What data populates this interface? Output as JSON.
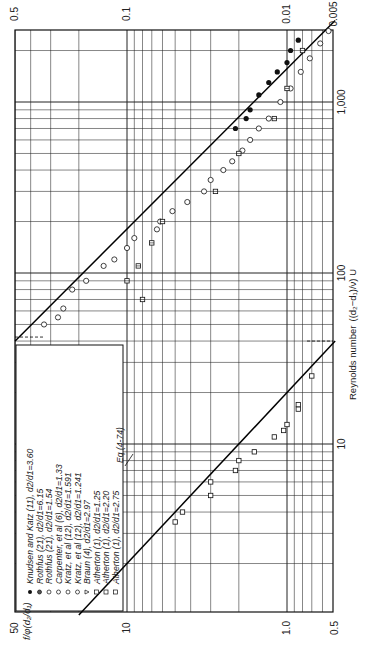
{
  "chart_data": {
    "type": "scatter",
    "title": "",
    "orientation": "rotated 90deg counter-clockwise (scanned figure)",
    "xlabel": "Reynolds number ((d2 - d1)/ν) U",
    "ylabel": "f/φ(d2/d1)",
    "xscale": "log",
    "yscale": "log",
    "xlim": [
      1,
      3000
    ],
    "ylim_left": [
      0.5,
      50
    ],
    "ylim_right": [
      0.005,
      0.5
    ],
    "x_ticks": [
      "10",
      "100",
      "1,000"
    ],
    "x_tick_values": [
      10,
      100,
      1000
    ],
    "y_ticks_left": [
      "50",
      "10",
      "1.0",
      "0.5"
    ],
    "y_tick_values_left": [
      50,
      10,
      1.0,
      0.5
    ],
    "y_ticks_right": [
      "0.5",
      "0.1",
      "0.01",
      "0.005"
    ],
    "y_tick_values_right": [
      0.5,
      0.1,
      0.01,
      0.005
    ],
    "grid": true,
    "legend_position": "upper left (rotated)",
    "legend": [
      {
        "symbol": "filled-circle",
        "label": "Knudsen and Katz (11), d2/d1=3.60"
      },
      {
        "symbol": "half-filled-circle",
        "label": "Rothfus (21), d2/d1=6.15"
      },
      {
        "symbol": "circle-tick",
        "label": "Rothfus (21), d2/d1=1.54"
      },
      {
        "symbol": "circle-bar",
        "label": "Carpenter, et al (6), d2/d1=1.33"
      },
      {
        "symbol": "circle-dot",
        "label": "Kratz, et al (12), d2/d1=1.591"
      },
      {
        "symbol": "diamond-circle",
        "label": "Kratz, et al (12), d2/d1=1.241"
      },
      {
        "symbol": "triangle",
        "label": "Braun (4), d2/d1=2.97"
      },
      {
        "symbol": "square-flag",
        "label": "Atherton (1), d2/d1=1.25"
      },
      {
        "symbol": "square-open",
        "label": "Atherton (1), d2/d1=2.20"
      },
      {
        "symbol": "square-d",
        "label": "Atherton (1), d2/d1=2.75"
      }
    ],
    "annotations": [
      {
        "text": "Eq (4-74)",
        "x": 8,
        "y": 2.4
      }
    ],
    "lines": [
      {
        "name": "Eq (4-74) laminar",
        "points": [
          [
            1,
            20
          ],
          [
            40,
            0.5
          ]
        ]
      },
      {
        "name": "turbulent",
        "points": [
          [
            40,
            50
          ],
          [
            3000,
            0.5
          ]
        ]
      }
    ],
    "series": [
      {
        "name": "laminar-region data",
        "symbol": "square-open",
        "points": [
          [
            3.5,
            5.0
          ],
          [
            4,
            4.5
          ],
          [
            5,
            3.0
          ],
          [
            6,
            3.0
          ],
          [
            7,
            2.1
          ],
          [
            8,
            2.0
          ],
          [
            9,
            1.6
          ],
          [
            11,
            1.2
          ],
          [
            12,
            1.05
          ],
          [
            13,
            1.0
          ],
          [
            16,
            0.85
          ],
          [
            17,
            0.85
          ],
          [
            25,
            0.7
          ]
        ]
      },
      {
        "name": "turbulent-region data (open)",
        "symbol": "circle-open",
        "points": [
          [
            50,
            33
          ],
          [
            55,
            27
          ],
          [
            62,
            25
          ],
          [
            80,
            22
          ],
          [
            90,
            18
          ],
          [
            110,
            14
          ],
          [
            120,
            12
          ],
          [
            140,
            10
          ],
          [
            160,
            9
          ],
          [
            180,
            6.5
          ],
          [
            200,
            6.2
          ],
          [
            230,
            5.2
          ],
          [
            260,
            4.2
          ],
          [
            300,
            3.3
          ],
          [
            350,
            3.0
          ],
          [
            400,
            2.5
          ],
          [
            450,
            2.2
          ],
          [
            520,
            1.9
          ],
          [
            600,
            1.7
          ],
          [
            700,
            1.5
          ],
          [
            800,
            1.3
          ],
          [
            1000,
            1.1
          ],
          [
            1200,
            0.95
          ],
          [
            1500,
            0.82
          ],
          [
            1800,
            0.72
          ],
          [
            2200,
            0.62
          ],
          [
            2600,
            0.55
          ]
        ]
      },
      {
        "name": "turbulent-region data (filled)",
        "symbol": "filled-circle",
        "points": [
          [
            700,
            2.1
          ],
          [
            800,
            1.8
          ],
          [
            900,
            1.7
          ],
          [
            1100,
            1.5
          ],
          [
            1300,
            1.3
          ],
          [
            1500,
            1.15
          ],
          [
            1700,
            1.0
          ],
          [
            2000,
            0.95
          ],
          [
            2300,
            0.85
          ]
        ]
      },
      {
        "name": "scatter below line",
        "symbol": "square-d",
        "points": [
          [
            70,
            8
          ],
          [
            90,
            10
          ],
          [
            110,
            8.5
          ],
          [
            150,
            7
          ],
          [
            200,
            6
          ],
          [
            300,
            2.8
          ],
          [
            500,
            2.0
          ],
          [
            800,
            1.2
          ],
          [
            1200,
            1.0
          ],
          [
            2000,
            0.8
          ]
        ]
      }
    ]
  },
  "labels": {
    "top_ticks": [
      "0.5",
      "0.1",
      "0.01",
      "0.005"
    ],
    "bottom_ticks": [
      "50",
      "10",
      "1.0",
      "0.5"
    ],
    "right_ticks": [
      "10",
      "100",
      "1,000"
    ],
    "xlabel": "Reynolds number",
    "xlabel_expr": "((d₂−d₁)/ν) U",
    "ylabel": "f/φ(d₂/d₁)",
    "annotation": "Eq (4-74)"
  }
}
